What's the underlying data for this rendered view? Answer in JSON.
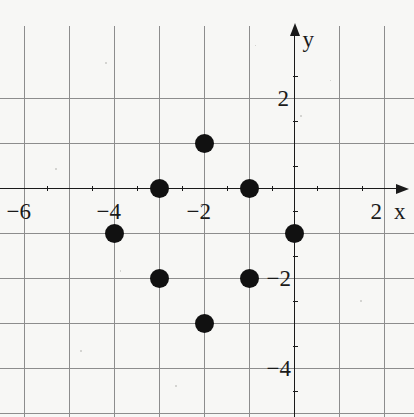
{
  "chart_data": {
    "type": "scatter",
    "title": "",
    "xlabel": "x",
    "ylabel": "y",
    "grid": true,
    "legend": "none",
    "xlim": [
      -6.6,
      2.65
    ],
    "ylim": [
      -5.1,
      2.85
    ],
    "x_tick_labels": [
      "-6",
      "-4",
      "-2",
      "2"
    ],
    "x_tick_values": [
      -6,
      -4,
      -2,
      2
    ],
    "y_tick_labels": [
      "2",
      "-2",
      "-4"
    ],
    "y_tick_values": [
      2,
      -2,
      -4
    ],
    "minor_ticks": true,
    "point_color": "#111111",
    "grid_color": "#8d8d8d",
    "axis_color": "#1a1a1a",
    "background_color": "#f7f7f5",
    "points": [
      {
        "x": -2,
        "y": 1
      },
      {
        "x": -3,
        "y": 0
      },
      {
        "x": -1,
        "y": 0
      },
      {
        "x": -4,
        "y": -1
      },
      {
        "x": 0,
        "y": -1
      },
      {
        "x": -3,
        "y": -2
      },
      {
        "x": -1,
        "y": -2
      },
      {
        "x": -2,
        "y": -3
      }
    ]
  },
  "axes": {
    "x_axis_label": "x",
    "y_axis_label": "y"
  }
}
